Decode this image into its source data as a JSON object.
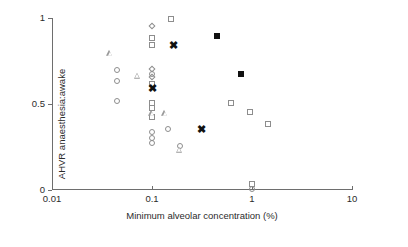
{
  "chart_data": {
    "type": "scatter",
    "title": "",
    "xlabel": "Minimum alveolar concentration (%)",
    "ylabel": "AHVR  anaesthesia:awake",
    "xscale": "log",
    "yscale": "linear",
    "xlim": [
      0.01,
      10
    ],
    "ylim": [
      0,
      1
    ],
    "grid": false,
    "legend": "none",
    "xticks": [
      {
        "value": 0.01,
        "label": "0.01"
      },
      {
        "value": 0.1,
        "label": "0.1"
      },
      {
        "value": 1,
        "label": "1"
      },
      {
        "value": 10,
        "label": "10"
      }
    ],
    "yticks": [
      {
        "value": 0,
        "label": "0"
      },
      {
        "value": 0.5,
        "label": "0.5"
      },
      {
        "value": 1,
        "label": "1"
      }
    ],
    "series": [
      {
        "name": "open-circle",
        "marker": "circle",
        "points": [
          {
            "x": 0.045,
            "y": 0.7
          },
          {
            "x": 0.045,
            "y": 0.635
          },
          {
            "x": 0.045,
            "y": 0.52
          },
          {
            "x": 0.1,
            "y": 0.675
          },
          {
            "x": 0.1,
            "y": 0.335
          },
          {
            "x": 0.1,
            "y": 0.305
          },
          {
            "x": 0.1,
            "y": 0.275
          },
          {
            "x": 0.145,
            "y": 0.355
          },
          {
            "x": 0.19,
            "y": 0.255
          },
          {
            "x": 1.0,
            "y": 0.005
          }
        ]
      },
      {
        "name": "open-square",
        "marker": "square",
        "points": [
          {
            "x": 0.1,
            "y": 0.885
          },
          {
            "x": 0.1,
            "y": 0.845
          },
          {
            "x": 0.1,
            "y": 0.615
          },
          {
            "x": 0.1,
            "y": 0.505
          },
          {
            "x": 0.1,
            "y": 0.475
          },
          {
            "x": 0.1,
            "y": 0.425
          },
          {
            "x": 0.155,
            "y": 0.995
          },
          {
            "x": 0.62,
            "y": 0.505
          },
          {
            "x": 0.95,
            "y": 0.455
          },
          {
            "x": 1.45,
            "y": 0.385
          },
          {
            "x": 1.0,
            "y": 0.035
          }
        ]
      },
      {
        "name": "open-triangle",
        "marker": "triangle",
        "points": [
          {
            "x": 0.038,
            "y": 0.795
          },
          {
            "x": 0.072,
            "y": 0.665
          },
          {
            "x": 0.1,
            "y": 0.445
          },
          {
            "x": 0.135,
            "y": 0.445
          },
          {
            "x": 0.19,
            "y": 0.235
          }
        ]
      },
      {
        "name": "open-diamond",
        "marker": "diamond",
        "points": [
          {
            "x": 0.1,
            "y": 0.955
          },
          {
            "x": 0.1,
            "y": 0.705
          },
          {
            "x": 0.1,
            "y": 0.655
          }
        ]
      },
      {
        "name": "filled-square",
        "marker": "square-filled",
        "points": [
          {
            "x": 0.45,
            "y": 0.895
          },
          {
            "x": 0.78,
            "y": 0.675
          }
        ]
      },
      {
        "name": "bold-x",
        "marker": "x",
        "points": [
          {
            "x": 0.165,
            "y": 0.845
          },
          {
            "x": 0.1,
            "y": 0.595
          },
          {
            "x": 0.31,
            "y": 0.355
          }
        ]
      }
    ]
  }
}
